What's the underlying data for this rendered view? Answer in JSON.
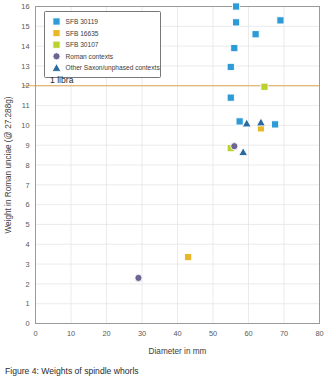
{
  "chart_data": {
    "type": "scatter",
    "title": "",
    "xlabel": "Diameter in mm",
    "ylabel": "Weight in Roman unciae (@ 27.288g)",
    "xlim": [
      0,
      80
    ],
    "ylim": [
      0,
      16
    ],
    "xticks": [
      0,
      10,
      20,
      30,
      40,
      50,
      60,
      70,
      80
    ],
    "yticks": [
      0,
      1,
      2,
      3,
      4,
      5,
      6,
      7,
      8,
      9,
      10,
      11,
      12,
      13,
      14,
      15,
      16
    ],
    "grid": true,
    "legend_position": "top-left",
    "annotations": [
      {
        "label": "1 libra",
        "y": 12,
        "color": "#e0a955",
        "type": "hline"
      }
    ],
    "series": [
      {
        "name": "SFB 30119",
        "marker": "square",
        "color": "#2e9bd6",
        "points": [
          {
            "x": 56.5,
            "y": 16.0
          },
          {
            "x": 56.5,
            "y": 15.2
          },
          {
            "x": 69.0,
            "y": 15.3
          },
          {
            "x": 62.0,
            "y": 14.6
          },
          {
            "x": 56.0,
            "y": 13.9
          },
          {
            "x": 55.0,
            "y": 12.95
          },
          {
            "x": 55.0,
            "y": 11.4
          },
          {
            "x": 57.5,
            "y": 10.2
          },
          {
            "x": 67.5,
            "y": 10.05
          }
        ]
      },
      {
        "name": "SFB 16635",
        "marker": "square",
        "color": "#e8b828",
        "points": [
          {
            "x": 43.0,
            "y": 3.35
          },
          {
            "x": 63.5,
            "y": 9.85
          }
        ]
      },
      {
        "name": "SFB 30107",
        "marker": "square",
        "color": "#bcd02e",
        "points": [
          {
            "x": 64.5,
            "y": 11.95
          },
          {
            "x": 55.0,
            "y": 8.85
          }
        ]
      },
      {
        "name": "Roman contexts",
        "marker": "circle",
        "color": "#6b6690",
        "points": [
          {
            "x": 29.0,
            "y": 2.3
          },
          {
            "x": 56.0,
            "y": 8.95
          }
        ]
      },
      {
        "name": "Other Saxon/unphased contexts",
        "marker": "triangle",
        "color": "#2b6a9e",
        "points": [
          {
            "x": 59.5,
            "y": 10.1
          },
          {
            "x": 63.5,
            "y": 10.15
          },
          {
            "x": 58.5,
            "y": 8.65
          }
        ]
      }
    ]
  },
  "legend": {
    "items": [
      {
        "label": "SFB 30119"
      },
      {
        "label": "SFB 16635"
      },
      {
        "label": "SFB 30107"
      },
      {
        "label": "Roman contexts"
      },
      {
        "label": "Other Saxon/unphased contexts"
      }
    ]
  },
  "axis": {
    "x_title": "Diameter in mm",
    "y_title": "Weight in Roman unciae (@ 27.288g)",
    "x_tick_labels": [
      "0",
      "10",
      "20",
      "30",
      "40",
      "50",
      "60",
      "70",
      "80"
    ],
    "y_tick_labels": [
      "0",
      "1",
      "2",
      "3",
      "4",
      "5",
      "6",
      "7",
      "8",
      "9",
      "10",
      "11",
      "12",
      "13",
      "14",
      "15",
      "16"
    ]
  },
  "annotation": {
    "libra_label": "1 libra"
  },
  "caption": {
    "text": "Figure 4: Weights of spindle whorls"
  }
}
